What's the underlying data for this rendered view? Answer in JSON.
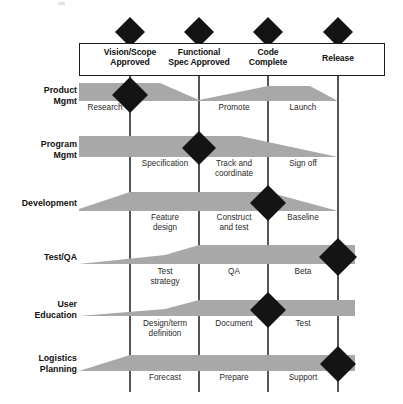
{
  "diagram": {
    "colors": {
      "band_gray": "#a8a8a8",
      "line_black": "#1d1d1d",
      "diamond_black": "#141414",
      "background": "#ffffff",
      "text": "#2a2a2a"
    },
    "milestones": [
      {
        "id": "vision-scope-approved",
        "label": "Vision/Scope\nApproved",
        "line1": "Vision/Scope",
        "line2": "Approved",
        "x": 130
      },
      {
        "id": "functional-spec-approved",
        "label": "Functional\nSpec Approved",
        "line1": "Functional",
        "line2": "Spec Approved",
        "x": 199
      },
      {
        "id": "code-complete",
        "label": "Code\nComplete",
        "line1": "Code",
        "line2": "Complete",
        "x": 268
      },
      {
        "id": "release",
        "label": "Release",
        "line1": "Release",
        "line2": "",
        "x": 338
      }
    ],
    "rows": [
      {
        "id": "product-mgmt",
        "label_line1": "Product",
        "label_line2": "Mgmt",
        "diamond_at": "vision-scope-approved",
        "tasks": [
          "Research",
          "Promote",
          "Launch"
        ]
      },
      {
        "id": "program-mgmt",
        "label_line1": "Program",
        "label_line2": "Mgmt",
        "diamond_at": "functional-spec-approved",
        "tasks": [
          "Specification",
          "Track and\ncoordinate",
          "Sign off"
        ]
      },
      {
        "id": "development",
        "label_line1": "Development",
        "label_line2": "",
        "diamond_at": "code-complete",
        "tasks": [
          "Feature\ndesign",
          "Construct\nand test",
          "Baseline"
        ]
      },
      {
        "id": "test-qa",
        "label_line1": "Test/QA",
        "label_line2": "",
        "diamond_at": "release",
        "tasks": [
          "Test\nstrategy",
          "QA",
          "Beta"
        ]
      },
      {
        "id": "user-education",
        "label_line1": "User",
        "label_line2": "Education",
        "diamond_at": "code-complete",
        "tasks": [
          "Design/term\ndefinition",
          "Document",
          "Test"
        ]
      },
      {
        "id": "logistics-planning",
        "label_line1": "Logistics",
        "label_line2": "Planning",
        "diamond_at": "release",
        "tasks": [
          "Forecast",
          "Prepare",
          "Support"
        ]
      }
    ]
  }
}
